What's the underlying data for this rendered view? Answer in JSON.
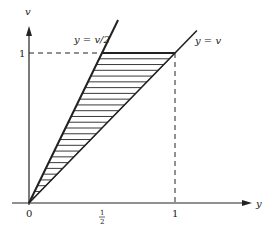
{
  "diagram": {
    "axes": {
      "x_label": "y",
      "y_label": "v",
      "x_ticks": [
        {
          "value": 0,
          "label": "0"
        },
        {
          "value": 0.5,
          "label_num": "1",
          "label_den": "2"
        },
        {
          "value": 1,
          "label": "1"
        }
      ],
      "y_ticks": [
        {
          "value": 1,
          "label": "1"
        }
      ]
    },
    "lines": [
      {
        "name": "line-y-equals-v-over-2",
        "label": "y = v/2",
        "slope_v_per_y": 2
      },
      {
        "name": "line-y-equals-v",
        "label": "y = v",
        "slope_v_per_y": 1
      }
    ],
    "shaded_region": {
      "description": "Region between y = v/2 and y = v for 0 ≤ v ≤ 1",
      "vertices": [
        [
          0,
          0
        ],
        [
          0.5,
          1
        ],
        [
          1,
          1
        ]
      ],
      "hatch": "horizontal"
    },
    "guides": [
      {
        "type": "dashed-horizontal",
        "at_v": 1,
        "from_y": 0,
        "to_y": 1
      },
      {
        "type": "dashed-vertical",
        "at_y": 1,
        "from_v": 0,
        "to_v": 1
      }
    ]
  }
}
